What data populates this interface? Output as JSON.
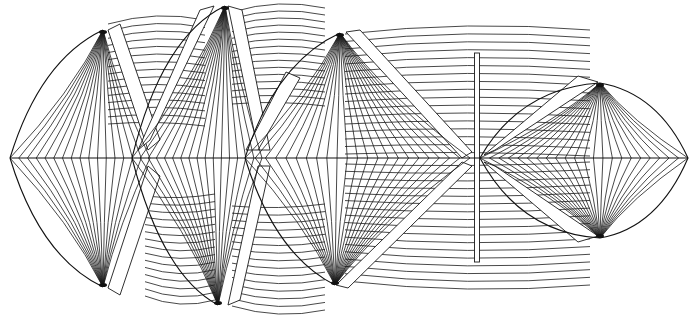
{
  "diagram": {
    "type": "line-drawing",
    "colors": {
      "background": "#ffffff",
      "stroke": "#1a1a1a",
      "shade": "#111111"
    },
    "centerline": {
      "y": 158,
      "x1": 10,
      "x2": 688
    },
    "fans": [
      {
        "id": "fan-1",
        "tip": [
          10,
          158
        ],
        "top": [
          103,
          30
        ],
        "bottom": [
          103,
          287
        ],
        "right_x": 150,
        "count": 16
      },
      {
        "id": "fan-2",
        "tip": [
          132,
          158
        ],
        "top": [
          225,
          6
        ],
        "bottom": [
          218,
          305
        ],
        "right_x": 262,
        "count": 16
      },
      {
        "id": "fan-3",
        "tip": [
          245,
          158
        ],
        "top": [
          340,
          33
        ],
        "bottom": [
          335,
          285
        ],
        "right_x": 470,
        "count": 22
      },
      {
        "id": "fan-4",
        "tip": [
          480,
          158
        ],
        "top": [
          600,
          83
        ],
        "bottom": [
          600,
          238
        ],
        "right_tip": [
          688,
          158
        ],
        "count": 22
      }
    ],
    "strake_groups": [
      {
        "id": "upper-1",
        "x1": 108,
        "x2": 205,
        "y_top": 20,
        "y_bottom": 120,
        "count": 14
      },
      {
        "id": "lower-1",
        "x1": 145,
        "x2": 215,
        "y_top": 200,
        "y_bottom": 300,
        "count": 14
      },
      {
        "id": "upper-2",
        "x1": 232,
        "x2": 325,
        "y_top": 8,
        "y_bottom": 100,
        "count": 14
      },
      {
        "id": "lower-2",
        "x1": 232,
        "x2": 325,
        "y_top": 210,
        "y_bottom": 310,
        "count": 14
      },
      {
        "id": "upper-3",
        "x1": 345,
        "x2": 590,
        "y_top": 30,
        "y_bottom": 150,
        "count": 16
      },
      {
        "id": "lower-3",
        "x1": 345,
        "x2": 590,
        "y_top": 168,
        "y_bottom": 285,
        "count": 16
      }
    ],
    "post": {
      "x": 477,
      "y_top": 53,
      "y_bottom": 262
    }
  }
}
